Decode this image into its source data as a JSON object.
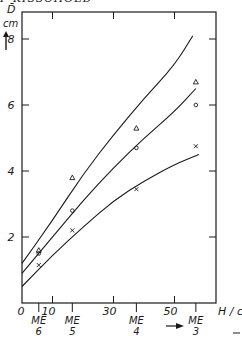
{
  "header": {
    "text": "P KISSCHOLD"
  },
  "chart_data": {
    "type": "line",
    "title": "",
    "ylabel_symbol": "D̄",
    "ylabel_unit": "cm",
    "xlabel": "H / cm",
    "xlim": [
      0,
      62
    ],
    "ylim": [
      0,
      8.3
    ],
    "x_ticks": [
      0,
      10,
      30,
      50
    ],
    "x_tick_labels": [
      "0",
      "10",
      "30",
      "50"
    ],
    "y_ticks": [
      2,
      4,
      6,
      8
    ],
    "y_tick_labels": [
      "2",
      "4",
      "6",
      "8"
    ],
    "me_markers": [
      {
        "label": "ME",
        "sub": "6",
        "x": 5.5
      },
      {
        "label": "ME",
        "sub": "5",
        "x": 16.5
      },
      {
        "label": "ME",
        "sub": "4",
        "x": 37.5
      },
      {
        "label": "ME",
        "sub": "3",
        "x": 57
      }
    ],
    "arrow_annotation": "→",
    "grid": false,
    "series": [
      {
        "name": "triangle",
        "marker": "triangle",
        "points": [
          [
            5.5,
            1.6
          ],
          [
            16.5,
            3.8
          ],
          [
            37.5,
            5.3
          ],
          [
            57,
            6.7
          ]
        ],
        "curve": [
          [
            0,
            1.2
          ],
          [
            10,
            2.5
          ],
          [
            20,
            3.9
          ],
          [
            30,
            5.1
          ],
          [
            40,
            6.2
          ],
          [
            50,
            7.2
          ],
          [
            56,
            8.1
          ]
        ]
      },
      {
        "name": "circle",
        "marker": "circle",
        "points": [
          [
            5.5,
            1.5
          ],
          [
            16.5,
            2.8
          ],
          [
            37.5,
            4.7
          ],
          [
            57,
            6.0
          ]
        ],
        "curve": [
          [
            0,
            0.9
          ],
          [
            10,
            2.0
          ],
          [
            20,
            3.1
          ],
          [
            30,
            4.1
          ],
          [
            40,
            5.0
          ],
          [
            50,
            5.8
          ],
          [
            57,
            6.5
          ]
        ]
      },
      {
        "name": "cross",
        "marker": "x",
        "points": [
          [
            5.5,
            1.15
          ],
          [
            16.5,
            2.2
          ],
          [
            37.5,
            3.45
          ],
          [
            57,
            4.75
          ]
        ],
        "curve": [
          [
            0,
            0.5
          ],
          [
            10,
            1.45
          ],
          [
            20,
            2.3
          ],
          [
            30,
            3.1
          ],
          [
            40,
            3.7
          ],
          [
            50,
            4.2
          ],
          [
            58,
            4.5
          ]
        ]
      }
    ]
  }
}
